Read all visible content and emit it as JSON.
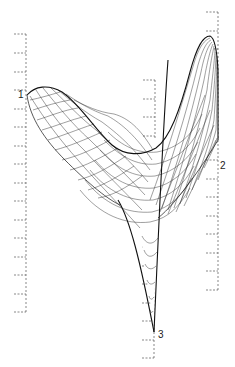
{
  "figure": {
    "line_color": "#1a1a1a",
    "axis_color": "#555555",
    "background": "#ffffff",
    "axes": [
      {
        "id": "1",
        "label": "1",
        "x": 26,
        "y_top": 34,
        "y_bottom": 312
      },
      {
        "id": "2",
        "label": "2",
        "x": 218,
        "y_top": 12,
        "y_bottom": 290
      },
      {
        "id": "3",
        "label": "3",
        "x": 154,
        "y_top": 262,
        "y_bottom": 360
      }
    ],
    "caption": ""
  }
}
